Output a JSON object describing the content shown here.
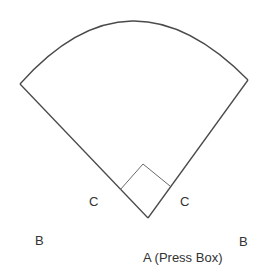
{
  "diagram": {
    "type": "baseball-field-layout",
    "labels": {
      "c_left": "C",
      "c_right": "C",
      "b_left": "B",
      "b_right": "B",
      "a_press_box": "A (Press Box)"
    },
    "colors": {
      "stroke": "#4a4a4a",
      "text": "#333333",
      "background": "#ffffff"
    }
  }
}
